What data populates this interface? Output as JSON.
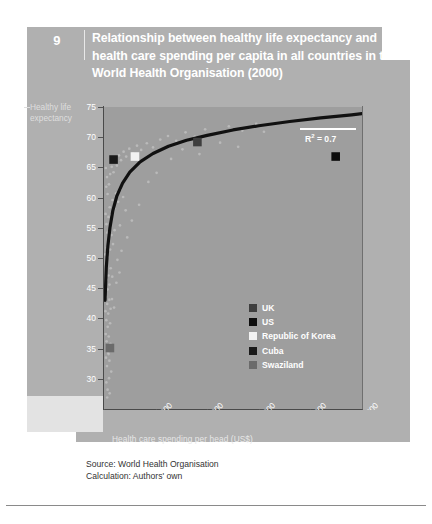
{
  "header": {
    "chapter_number": "9",
    "title": "Relationship between healthy life expectancy and health care spending per capita in all countries in the World Health Organisation (2000)"
  },
  "source": {
    "line1": "Source:  World Health Organisation",
    "line2": "Calculation: Authors' own"
  },
  "annotation": {
    "r2_prefix": "R",
    "r2_sup": "2",
    "r2_value": " = 0.7"
  },
  "colors": {
    "panel": "#b0b0b0",
    "band": "#c9c9c9",
    "plot_bg": "#9e9e9e",
    "axis": "#4a4a4a",
    "trend": "#111111",
    "cloud": "#c2c2c2",
    "uk": "#3e3e3e",
    "us": "#0d0d0d",
    "korea": "#f2f2f2",
    "cuba": "#1a1a1a",
    "swaziland": "#6b6b6b"
  },
  "chart_data": {
    "type": "scatter",
    "title": "Relationship between healthy life expectancy and health care spending per capita in all countries in the World Health Organisation (2000)",
    "xlabel": "Health care spending per head (US$)",
    "ylabel": "Healthy life expectancy",
    "xlim": [
      0,
      5000
    ],
    "ylim": [
      25,
      75
    ],
    "xticks": [
      0,
      1000,
      2000,
      3000,
      4000,
      5000
    ],
    "xtick_labels": [
      "0",
      "1000",
      "2000",
      "3000",
      "4000",
      "5000"
    ],
    "yticks": [
      25,
      30,
      35,
      40,
      45,
      50,
      55,
      60,
      65,
      70,
      75
    ],
    "ytick_labels": [
      "25",
      "30",
      "35",
      "40",
      "45",
      "50",
      "55",
      "60",
      "65",
      "70",
      "75"
    ],
    "grid": false,
    "legend_position": "inside-lower-right",
    "r_squared": 0.7,
    "trend_type": "logarithmic",
    "trend_note": "Fitted logarithmic curve rising steeply from ~43 years at near-zero spending to ~74 years at 5000 US$",
    "trend_points": [
      {
        "x": 20,
        "y": 43.0
      },
      {
        "x": 45,
        "y": 48.5
      },
      {
        "x": 75,
        "y": 52.0
      },
      {
        "x": 115,
        "y": 55.0
      },
      {
        "x": 170,
        "y": 57.8
      },
      {
        "x": 250,
        "y": 60.3
      },
      {
        "x": 360,
        "y": 62.4
      },
      {
        "x": 500,
        "y": 64.2
      },
      {
        "x": 700,
        "y": 65.9
      },
      {
        "x": 950,
        "y": 67.3
      },
      {
        "x": 1250,
        "y": 68.5
      },
      {
        "x": 1600,
        "y": 69.5
      },
      {
        "x": 2000,
        "y": 70.3
      },
      {
        "x": 2500,
        "y": 71.2
      },
      {
        "x": 3000,
        "y": 71.9
      },
      {
        "x": 3600,
        "y": 72.6
      },
      {
        "x": 4200,
        "y": 73.2
      },
      {
        "x": 4800,
        "y": 73.7
      },
      {
        "x": 5000,
        "y": 73.9
      }
    ],
    "highlighted": [
      {
        "name": "UK",
        "x": 1810,
        "y": 69.2,
        "color": "#3e3e3e"
      },
      {
        "name": "US",
        "x": 4490,
        "y": 66.8,
        "color": "#0d0d0d"
      },
      {
        "name": "Republic of Korea",
        "x": 600,
        "y": 66.8,
        "color": "#f2f2f2"
      },
      {
        "name": "Cuba",
        "x": 185,
        "y": 66.3,
        "color": "#1a1a1a"
      },
      {
        "name": "Swaziland",
        "x": 115,
        "y": 35.1,
        "color": "#6b6b6b"
      }
    ],
    "legend": [
      {
        "label": "UK",
        "color": "#3e3e3e"
      },
      {
        "label": "US",
        "color": "#0d0d0d"
      },
      {
        "label": "Republic of Korea",
        "color": "#f2f2f2"
      },
      {
        "label": "Cuba",
        "color": "#1a1a1a"
      },
      {
        "label": "Swaziland",
        "color": "#6b6b6b"
      }
    ],
    "points": [
      {
        "x": 35,
        "y": 64.9
      },
      {
        "x": 58,
        "y": 63.4
      },
      {
        "x": 44,
        "y": 61.8
      },
      {
        "x": 70,
        "y": 60.6
      },
      {
        "x": 96,
        "y": 62.2
      },
      {
        "x": 120,
        "y": 63.9
      },
      {
        "x": 150,
        "y": 65.1
      },
      {
        "x": 185,
        "y": 64.2
      },
      {
        "x": 210,
        "y": 66.0
      },
      {
        "x": 250,
        "y": 65.3
      },
      {
        "x": 290,
        "y": 67.0
      },
      {
        "x": 330,
        "y": 66.2
      },
      {
        "x": 380,
        "y": 67.6
      },
      {
        "x": 430,
        "y": 66.8
      },
      {
        "x": 490,
        "y": 68.1
      },
      {
        "x": 560,
        "y": 67.3
      },
      {
        "x": 640,
        "y": 68.6
      },
      {
        "x": 720,
        "y": 67.9
      },
      {
        "x": 830,
        "y": 69.0
      },
      {
        "x": 950,
        "y": 68.3
      },
      {
        "x": 1090,
        "y": 69.6
      },
      {
        "x": 1240,
        "y": 70.2
      },
      {
        "x": 1400,
        "y": 69.4
      },
      {
        "x": 1580,
        "y": 70.8
      },
      {
        "x": 1760,
        "y": 70.1
      },
      {
        "x": 1960,
        "y": 71.3
      },
      {
        "x": 2180,
        "y": 70.6
      },
      {
        "x": 2420,
        "y": 71.8
      },
      {
        "x": 2680,
        "y": 71.1
      },
      {
        "x": 2950,
        "y": 72.2
      },
      {
        "x": 30,
        "y": 57.3
      },
      {
        "x": 48,
        "y": 55.6
      },
      {
        "x": 66,
        "y": 54.2
      },
      {
        "x": 88,
        "y": 56.8
      },
      {
        "x": 110,
        "y": 58.4
      },
      {
        "x": 138,
        "y": 57.1
      },
      {
        "x": 165,
        "y": 59.6
      },
      {
        "x": 198,
        "y": 58.2
      },
      {
        "x": 235,
        "y": 60.7
      },
      {
        "x": 275,
        "y": 59.3
      },
      {
        "x": 320,
        "y": 61.4
      },
      {
        "x": 370,
        "y": 60.1
      },
      {
        "x": 25,
        "y": 50.6
      },
      {
        "x": 40,
        "y": 48.9
      },
      {
        "x": 56,
        "y": 51.7
      },
      {
        "x": 74,
        "y": 50.2
      },
      {
        "x": 95,
        "y": 52.9
      },
      {
        "x": 118,
        "y": 51.4
      },
      {
        "x": 145,
        "y": 53.8
      },
      {
        "x": 175,
        "y": 52.3
      },
      {
        "x": 205,
        "y": 54.6
      },
      {
        "x": 22,
        "y": 45.2
      },
      {
        "x": 36,
        "y": 43.6
      },
      {
        "x": 52,
        "y": 46.4
      },
      {
        "x": 68,
        "y": 44.8
      },
      {
        "x": 86,
        "y": 47.1
      },
      {
        "x": 106,
        "y": 45.6
      },
      {
        "x": 130,
        "y": 48.3
      },
      {
        "x": 160,
        "y": 46.9
      },
      {
        "x": 28,
        "y": 41.2
      },
      {
        "x": 45,
        "y": 39.7
      },
      {
        "x": 62,
        "y": 42.4
      },
      {
        "x": 82,
        "y": 40.8
      },
      {
        "x": 104,
        "y": 43.1
      },
      {
        "x": 128,
        "y": 41.6
      },
      {
        "x": 33,
        "y": 37.4
      },
      {
        "x": 50,
        "y": 36.2
      },
      {
        "x": 72,
        "y": 38.6
      },
      {
        "x": 92,
        "y": 37.0
      },
      {
        "x": 118,
        "y": 39.2
      },
      {
        "x": 38,
        "y": 33.5
      },
      {
        "x": 58,
        "y": 32.1
      },
      {
        "x": 80,
        "y": 34.3
      },
      {
        "x": 105,
        "y": 33.0
      },
      {
        "x": 140,
        "y": 31.2
      },
      {
        "x": 46,
        "y": 29.4
      },
      {
        "x": 70,
        "y": 28.2
      },
      {
        "x": 98,
        "y": 30.1
      },
      {
        "x": 310,
        "y": 55.4
      },
      {
        "x": 420,
        "y": 57.9
      },
      {
        "x": 540,
        "y": 56.2
      },
      {
        "x": 680,
        "y": 58.8
      },
      {
        "x": 860,
        "y": 62.6
      },
      {
        "x": 1020,
        "y": 64.1
      },
      {
        "x": 1300,
        "y": 66.4
      },
      {
        "x": 1520,
        "y": 68.0
      },
      {
        "x": 1850,
        "y": 67.2
      },
      {
        "x": 2250,
        "y": 69.1
      },
      {
        "x": 2600,
        "y": 68.4
      },
      {
        "x": 3100,
        "y": 70.9
      },
      {
        "x": 260,
        "y": 49.7
      },
      {
        "x": 340,
        "y": 51.2
      },
      {
        "x": 450,
        "y": 53.4
      },
      {
        "x": 155,
        "y": 43.2
      },
      {
        "x": 195,
        "y": 41.8
      },
      {
        "x": 240,
        "y": 45.9
      },
      {
        "x": 300,
        "y": 47.6
      },
      {
        "x": 125,
        "y": 35.8
      },
      {
        "x": 88,
        "y": 34.1
      },
      {
        "x": 62,
        "y": 26.9
      },
      {
        "x": 110,
        "y": 27.6
      }
    ]
  }
}
